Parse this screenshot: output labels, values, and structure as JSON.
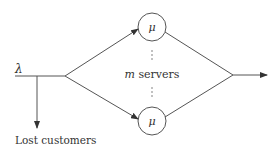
{
  "diagram": {
    "type": "queueing-system",
    "arrival_rate_label": "λ",
    "service_rate_label": "μ",
    "servers_label_var": "m",
    "servers_label_text": "servers",
    "lost_label": "Lost customers",
    "vertical_ellipsis": "⋮",
    "colors": {
      "line": "#555555",
      "text": "#333333",
      "background": "#ffffff"
    }
  }
}
